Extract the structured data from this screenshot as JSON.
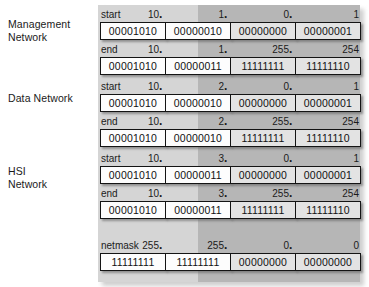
{
  "figure": {
    "octet_dot": "."
  },
  "networks": [
    {
      "name": "Management Network",
      "label_lines": [
        "Management",
        "Network"
      ],
      "rows": [
        {
          "kind": "start",
          "decimal": [
            "10",
            "1",
            "0",
            "1"
          ],
          "binary": [
            "00001010",
            "00000010",
            "00000000",
            "00000001"
          ],
          "shading": [
            "net",
            "net",
            "host",
            "host"
          ]
        },
        {
          "kind": "end",
          "decimal": [
            "10",
            "1",
            "255",
            "254"
          ],
          "binary": [
            "00001010",
            "00000011",
            "11111111",
            "11111110"
          ],
          "shading": [
            "net",
            "net",
            "host",
            "host"
          ]
        }
      ]
    },
    {
      "name": "Data Network",
      "label_lines": [
        "Data Network"
      ],
      "rows": [
        {
          "kind": "start",
          "decimal": [
            "10",
            "2",
            "0",
            "1"
          ],
          "binary": [
            "00001010",
            "00000010",
            "00000000",
            "00000001"
          ],
          "shading": [
            "net",
            "net",
            "host",
            "host"
          ]
        },
        {
          "kind": "end",
          "decimal": [
            "10",
            "2",
            "255",
            "254"
          ],
          "binary": [
            "00001010",
            "00000010",
            "11111111",
            "11111110"
          ],
          "shading": [
            "net",
            "net",
            "host",
            "host"
          ]
        }
      ]
    },
    {
      "name": "HSI Network",
      "label_lines": [
        "HSI",
        "Network"
      ],
      "rows": [
        {
          "kind": "start",
          "decimal": [
            "10",
            "3",
            "0",
            "1"
          ],
          "binary": [
            "00001010",
            "00000011",
            "00000000",
            "00000001"
          ],
          "shading": [
            "net",
            "net",
            "host",
            "host"
          ]
        },
        {
          "kind": "end",
          "decimal": [
            "10",
            "3",
            "255",
            "254"
          ],
          "binary": [
            "00001010",
            "00000011",
            "11111111",
            "11111110"
          ],
          "shading": [
            "net",
            "net",
            "host",
            "host"
          ]
        }
      ]
    }
  ],
  "netmask": {
    "kind": "netmask",
    "decimal": [
      "255",
      "255",
      "0",
      "0"
    ],
    "binary": [
      "11111111",
      "11111111",
      "00000000",
      "00000000"
    ],
    "shading": [
      "net",
      "net",
      "host",
      "host"
    ]
  },
  "colors": {
    "panel_left": "#d5d5d5",
    "panel_right": "#b6b6b6",
    "box_network": "#fdfdfd",
    "box_host": "#e3e3e3",
    "box_border": "#141414",
    "text": "#1b1b1b"
  },
  "layout": {
    "label_tops": [
      18,
      92,
      165
    ],
    "row_tops": [
      8,
      43,
      80,
      115,
      152,
      187,
      239
    ],
    "netmask_label_offset": 0
  }
}
